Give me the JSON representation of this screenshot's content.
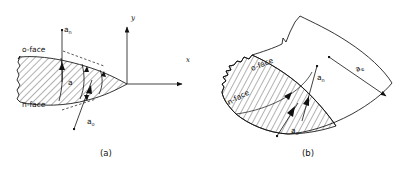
{
  "figure": {
    "ink_color": "#111111",
    "background_color": "#ffffff",
    "panels": [
      {
        "caption": "(a)",
        "caption_x": 100,
        "caption_y": 156,
        "axes": [
          {
            "name": "y",
            "label": "y",
            "label_x": 131,
            "label_y": 20
          },
          {
            "name": "x",
            "label": "x",
            "label_x": 186,
            "label_y": 62
          }
        ],
        "labels": [
          {
            "name": "o-face",
            "text": "o",
            "sub": "",
            "suffix": "-face",
            "x": 22,
            "y": 52
          },
          {
            "name": "n-face",
            "text": "n",
            "sub": "",
            "suffix": "-face",
            "x": 22,
            "y": 107
          },
          {
            "name": "a-n-vector",
            "text": "a",
            "sub": "n",
            "suffix": "",
            "x": 64,
            "y": 32
          },
          {
            "name": "a-o-vector",
            "text": "a",
            "sub": "o",
            "suffix": "",
            "x": 87,
            "y": 124
          },
          {
            "name": "a-center",
            "text": "a",
            "sub": "",
            "suffix": "",
            "x": 70,
            "y": 83
          }
        ]
      },
      {
        "caption": "(b)",
        "caption_x": 302,
        "caption_y": 156,
        "labels": [
          {
            "name": "o-face",
            "text": "o",
            "sub": "",
            "suffix": "-face",
            "x": 252,
            "y": 71,
            "rotate": -22
          },
          {
            "name": "n-face",
            "text": "n",
            "sub": "",
            "suffix": "-face",
            "x": 229,
            "y": 105,
            "rotate": -28
          },
          {
            "name": "a-n-vector",
            "text": "a",
            "sub": "n",
            "suffix": "",
            "x": 317,
            "y": 80
          },
          {
            "name": "a-o-vector",
            "text": "a",
            "sub": "o",
            "suffix": "",
            "x": 291,
            "y": 133
          },
          {
            "name": "a-e-vector",
            "text": "a",
            "sub": "e",
            "suffix": "",
            "x": 357,
            "y": 72,
            "rotate": -30
          }
        ]
      }
    ]
  }
}
